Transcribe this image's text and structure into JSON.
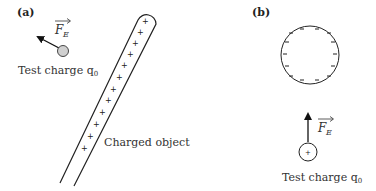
{
  "panels": {
    "a": {
      "label": "(a)",
      "force_label": "F",
      "force_subscript": "E",
      "test_charge_label": "Test charge q",
      "test_charge_subscript": "0",
      "object_label": "Charged object",
      "object_charge_sign": "+",
      "object_charge_count": 12,
      "test_charge_fill": "#d0d0d0"
    },
    "b": {
      "label": "(b)",
      "force_label": "F",
      "force_subscript": "E",
      "test_charge_label": "Test charge q",
      "test_charge_subscript": "0",
      "test_charge_sign": "+",
      "sphere_charge_sign": "−",
      "sphere_charge_count": 14
    }
  }
}
